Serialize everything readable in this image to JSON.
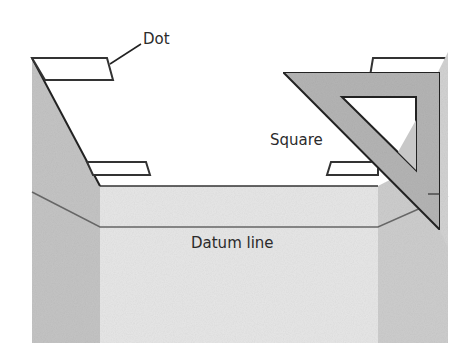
{
  "diagram": {
    "labels": {
      "dot": "Dot",
      "square": "Square",
      "datum_line": "Datum line"
    },
    "colors": {
      "left_wall": "#c4c4c4",
      "floor": "#e6e6e6",
      "right_wall": "#cdcdcd",
      "square_fill": "#b4b4b4",
      "outline": "#222222",
      "datum_line": "#666666",
      "dot_fill": "#ffffff"
    }
  }
}
